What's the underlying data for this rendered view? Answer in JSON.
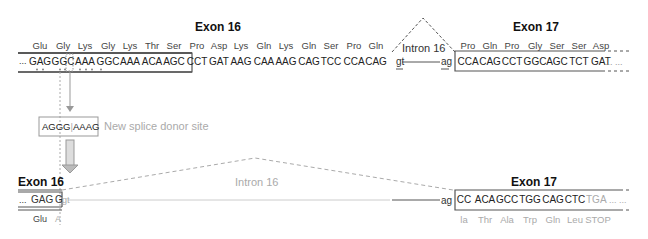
{
  "top": {
    "exon16": {
      "title": "Exon 16",
      "amino_acids": [
        "Glu",
        "Gly",
        "Lys",
        "Gly",
        "Lys",
        "Thr",
        "Ser",
        "Pro",
        "Asp",
        "Lys",
        "Gln",
        "Lys",
        "Gln",
        "Ser",
        "Pro",
        "Gln"
      ],
      "codons": [
        "GAG",
        "GGC",
        "AAA",
        "GGC",
        "AAA",
        "ACA",
        "AGC",
        "CCT",
        "GAT",
        "AAG",
        "CAA",
        "AAG",
        "CAG",
        "TCC",
        "CCA",
        "CAG"
      ],
      "leading_ellipsis": "...",
      "donor": "gt"
    },
    "intron": {
      "label": "Intron 16"
    },
    "exon17": {
      "title": "Exon 17",
      "acceptor": "ag",
      "amino_acids": [
        "Pro",
        "Gln",
        "Pro",
        "Gly",
        "Ser",
        "Ser",
        "Asp"
      ],
      "codons": [
        "CCA",
        "CAG",
        "CCT",
        "GGC",
        "AGC",
        "TCT",
        "GAT"
      ],
      "trailing_ellipsis": "... ..."
    }
  },
  "mutation": {
    "sequence_left": "AGGG",
    "sequence_right": "AAAG",
    "separator": "|",
    "label": "New splice donor site"
  },
  "bottom": {
    "exon16": {
      "title": "Exon 16",
      "leading_ellipsis": "...",
      "codon": "GAG",
      "partial": "G",
      "donor": "gt",
      "amino_acid": "Glu",
      "partial_aa": "A"
    },
    "intron": {
      "label": "Intron 16"
    },
    "exon17": {
      "title": "Exon 17",
      "acceptor": "ag",
      "codons": [
        "CC",
        "ACA",
        "GCC",
        "TGG",
        "CAG",
        "CTC"
      ],
      "stop_codon": "TGA",
      "trailing_ellipsis": "... ...",
      "amino_acids": [
        "la",
        "Thr",
        "Ala",
        "Trp",
        "Gln",
        "Leu",
        "STOP"
      ]
    }
  }
}
